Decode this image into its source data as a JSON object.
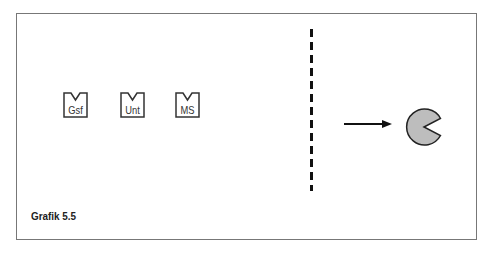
{
  "diagram": {
    "boxes": [
      {
        "label": "Gsf"
      },
      {
        "label": "Unt"
      },
      {
        "label": "MS"
      }
    ],
    "caption": "Grafik 5.5",
    "colors": {
      "frame": "#777777",
      "shape_fill": "#bdbdbd",
      "stroke": "#222222"
    }
  }
}
